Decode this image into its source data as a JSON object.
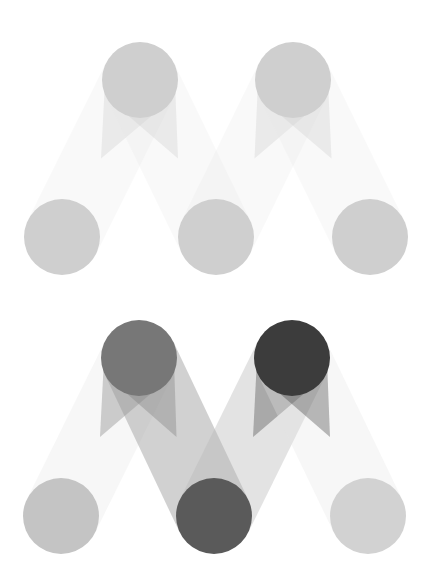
{
  "logos": [
    {
      "name": "logo-light",
      "circles": [
        {
          "id": "bottom-left",
          "cx": 62,
          "cy": 237,
          "color": "#cfcfcf"
        },
        {
          "id": "top-left",
          "cx": 140,
          "cy": 80,
          "color": "#cfcfcf"
        },
        {
          "id": "bottom-middle",
          "cx": 216,
          "cy": 237,
          "color": "#cfcfcf"
        },
        {
          "id": "top-right",
          "cx": 293,
          "cy": 80,
          "color": "#cfcfcf"
        },
        {
          "id": "bottom-right",
          "cx": 370,
          "cy": 237,
          "color": "#cfcfcf"
        }
      ],
      "bands": [
        {
          "from": "bottom-left",
          "to": "top-left",
          "color": "#e6e6e6",
          "opacity": 0.25
        },
        {
          "from": "top-left",
          "to": "bottom-middle",
          "color": "#e6e6e6",
          "opacity": 0.25
        },
        {
          "from": "bottom-middle",
          "to": "top-right",
          "color": "#e6e6e6",
          "opacity": 0.25
        },
        {
          "from": "top-right",
          "to": "bottom-right",
          "color": "#e6e6e6",
          "opacity": 0.25
        }
      ]
    },
    {
      "name": "logo-dark",
      "circles": [
        {
          "id": "bottom-left",
          "cx": 61,
          "cy": 237,
          "color": "#c4c4c4"
        },
        {
          "id": "top-left",
          "cx": 139,
          "cy": 79,
          "color": "#777777"
        },
        {
          "id": "bottom-middle",
          "cx": 214,
          "cy": 237,
          "color": "#5a5a5a"
        },
        {
          "id": "top-right",
          "cx": 292,
          "cy": 79,
          "color": "#3c3c3c"
        },
        {
          "id": "bottom-right",
          "cx": 368,
          "cy": 237,
          "color": "#d2d2d2"
        }
      ],
      "bands": [
        {
          "from": "bottom-left",
          "to": "top-left",
          "color": "#e4e4e4",
          "opacity": 0.3
        },
        {
          "from": "top-left",
          "to": "bottom-middle",
          "color": "#9a9a9a",
          "opacity": 0.45
        },
        {
          "from": "bottom-middle",
          "to": "top-right",
          "color": "#b8b8b8",
          "opacity": 0.4
        },
        {
          "from": "top-right",
          "to": "bottom-right",
          "color": "#e6e6e6",
          "opacity": 0.3
        }
      ]
    }
  ],
  "radius": 38
}
